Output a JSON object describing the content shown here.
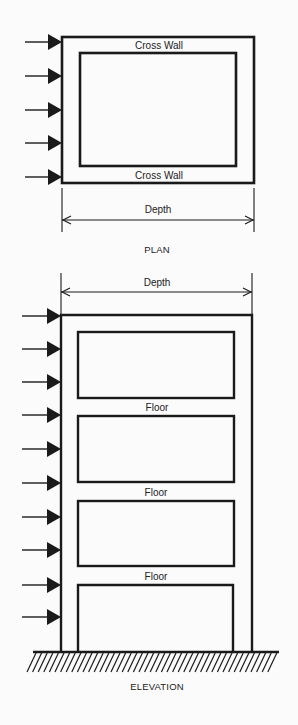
{
  "colors": {
    "ink": "#1a1a1a",
    "background": "#fbfbfb"
  },
  "plan": {
    "caption": "PLAN",
    "top_wall_label": "Cross Wall",
    "bottom_wall_label": "Cross Wall",
    "dimension_label": "Depth",
    "outer_rect": {
      "x": 62,
      "y": 37,
      "w": 192,
      "h": 146
    },
    "inner_rect": {
      "x": 80,
      "y": 53,
      "w": 156,
      "h": 113
    },
    "arrow_ys": [
      42,
      76,
      110,
      143,
      177
    ],
    "arrow_x_start": 25,
    "arrow_x_end": 62,
    "dimension": {
      "x1": 62,
      "x2": 254,
      "y": 220,
      "ext_top": 188,
      "ext_bottom": 232
    }
  },
  "elevation": {
    "caption": "ELEVATION",
    "dimension_label": "Depth",
    "floor_labels": [
      "Floor",
      "Floor",
      "Floor"
    ],
    "columns": {
      "left_x": 61,
      "right_x": 252,
      "top_y": 315,
      "ground_y": 652
    },
    "openings": [
      {
        "x": 78,
        "y": 332,
        "w": 156,
        "h": 66
      },
      {
        "x": 78,
        "y": 416,
        "w": 156,
        "h": 66
      },
      {
        "x": 78,
        "y": 501,
        "w": 156,
        "h": 65
      },
      {
        "x": 78,
        "y": 585,
        "w": 155,
        "h": 67,
        "open_bottom": true
      }
    ],
    "arrow_ys": [
      316,
      349,
      382,
      415,
      449,
      483,
      517,
      550,
      585,
      617
    ],
    "arrow_x_start": 22,
    "arrow_x_end": 61,
    "dimension": {
      "x1": 61,
      "x2": 252,
      "y": 292,
      "ext_top": 273,
      "ext_bottom": 315
    },
    "ground": {
      "x1": 33,
      "x2": 279,
      "y": 652,
      "hatch_depth": 20,
      "hatch_spacing": 5.6
    }
  },
  "labels": [
    {
      "id": "plan-top-cross-wall",
      "text_path": "plan.top_wall_label",
      "x": 159,
      "y": 46
    },
    {
      "id": "plan-bottom-cross-wall",
      "text_path": "plan.bottom_wall_label",
      "x": 159,
      "y": 176
    },
    {
      "id": "plan-depth",
      "text_path": "plan.dimension_label",
      "x": 158,
      "y": 210
    },
    {
      "id": "plan-caption",
      "text_path": "plan.caption",
      "x": 157,
      "y": 250
    },
    {
      "id": "elev-depth",
      "text_path": "elevation.dimension_label",
      "x": 157,
      "y": 283
    },
    {
      "id": "floor-1",
      "text_path": "elevation.floor_labels.0",
      "x": 157,
      "y": 408
    },
    {
      "id": "floor-2",
      "text_path": "elevation.floor_labels.1",
      "x": 156,
      "y": 493
    },
    {
      "id": "floor-3",
      "text_path": "elevation.floor_labels.2",
      "x": 156,
      "y": 577
    },
    {
      "id": "elev-caption",
      "text_path": "elevation.caption",
      "x": 157,
      "y": 687
    }
  ]
}
